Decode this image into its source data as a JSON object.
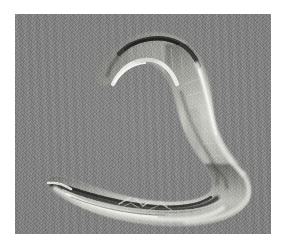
{
  "image": {
    "kind": "micrograph",
    "modality": "DIC / Nomarski differential interference contrast",
    "subject": "nematode worm (C. elegans)",
    "title": "Nematode DIC Micrograph",
    "alt_text": "Differential interference contrast micrograph of a single nematode worm curled into an S shape on a uniform gray field",
    "frame": {
      "canvas_width": 287,
      "canvas_height": 250,
      "margin_color": "#ffffff",
      "plate_left": 15,
      "plate_top": 14,
      "plate_width": 256,
      "plate_height": 220
    },
    "colors": {
      "background_gray": "#808080",
      "highlight": "#e8e8e4",
      "shadow": "#2a2a2a",
      "midtone": "#9a9a96",
      "margin": "#ffffff"
    },
    "regions": [
      {
        "name": "head",
        "label": "anterior tip",
        "x": 96,
        "y": 58
      },
      {
        "name": "dorsal-shadow",
        "label": "dark relief edge",
        "x": 140,
        "y": 20
      },
      {
        "name": "midbody",
        "label": "body wall with highlight",
        "x": 215,
        "y": 110
      },
      {
        "name": "gut-striations",
        "label": "intestinal striations",
        "x": 130,
        "y": 195
      },
      {
        "name": "tail",
        "label": "posterior tip",
        "x": 40,
        "y": 180
      }
    ]
  }
}
